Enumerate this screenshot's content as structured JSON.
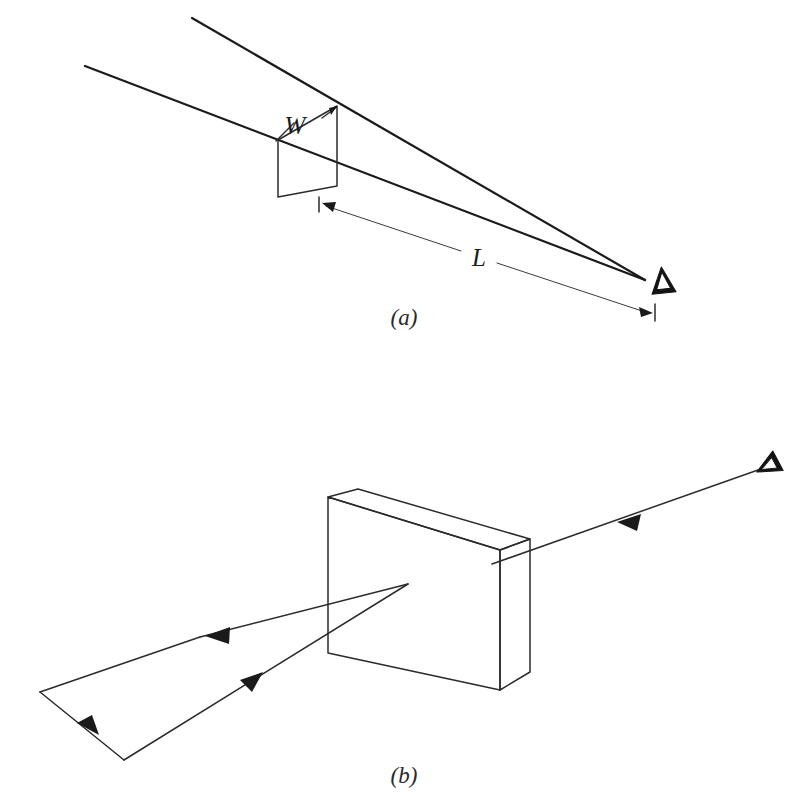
{
  "page": {
    "background_color": "#ffffff",
    "ink_color": "#1a1a1a",
    "width": 796,
    "height": 796
  },
  "panels": [
    {
      "id": "a",
      "caption": "(a)",
      "caption_x": 404,
      "caption_y": 325,
      "labels": {
        "width_symbol": "W",
        "length_symbol": "L"
      },
      "icons": {
        "viewer": "eye-icon"
      }
    },
    {
      "id": "b",
      "caption": "(b)",
      "caption_x": 404,
      "caption_y": 783,
      "labels": {},
      "icons": {
        "viewer": "eye-icon"
      }
    }
  ],
  "panel_a": {
    "caption": "(a)",
    "width_label": "W",
    "length_label": "L",
    "viewer_icon": "eye-icon",
    "geometry": {
      "aperture_quad": "278,140 337,106 337,186 278,197",
      "ray_upper": "192,18 645,280",
      "ray_lower": "85,66 645,280",
      "dimension_line": "325,205 651,313"
    }
  },
  "panel_b": {
    "caption": "(b)",
    "viewer_icon": "eye-icon",
    "geometry": {
      "slab_front_face": "328,497 500,550 500,690 328,653",
      "slab_top_face": "328,497 358,489 530,539 500,550",
      "slab_right_face": "500,550 530,539 530,672 500,690",
      "incoming_ray": "758,470 492,564",
      "outgoing_ray_1": "408,584 200,637",
      "outgoing_ray_2": "40,692 124,760",
      "outgoing_ray_3": "124,760 408,584"
    }
  },
  "colors": {
    "ink": "#1a1a1a",
    "ink_soft": "#2b2b2b",
    "ink_thin": "#3a3a3a",
    "paper": "#ffffff"
  }
}
